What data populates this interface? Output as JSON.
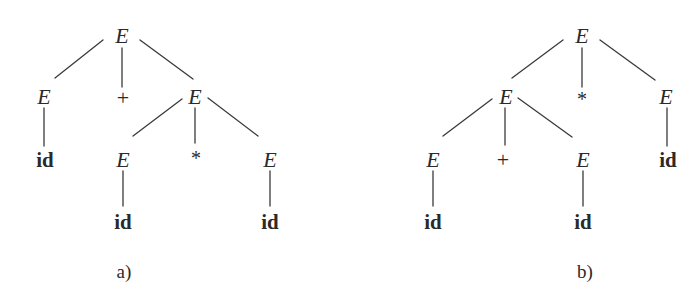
{
  "figure": {
    "background": "#ffffff",
    "ink_color": "#2a2a2a",
    "trees": [
      {
        "id": "tree-a",
        "caption": "a)",
        "caption_pos": [
          124,
          271
        ],
        "nodes": [
          {
            "key": "a_root",
            "label": "E",
            "kind": "nonterminal",
            "x": 122,
            "y": 36
          },
          {
            "key": "a_l",
            "label": "E",
            "kind": "nonterminal",
            "x": 44,
            "y": 97
          },
          {
            "key": "a_plus",
            "label": "+",
            "kind": "operator",
            "x": 123,
            "y": 98
          },
          {
            "key": "a_r",
            "label": "E",
            "kind": "nonterminal",
            "x": 195,
            "y": 97
          },
          {
            "key": "a_l_id",
            "label": "id",
            "kind": "terminal",
            "x": 45,
            "y": 160
          },
          {
            "key": "a_rl",
            "label": "E",
            "kind": "nonterminal",
            "x": 123,
            "y": 160
          },
          {
            "key": "a_star",
            "label": "*",
            "kind": "operator",
            "x": 196,
            "y": 158
          },
          {
            "key": "a_rr",
            "label": "E",
            "kind": "nonterminal",
            "x": 270,
            "y": 160
          },
          {
            "key": "a_rl_id",
            "label": "id",
            "kind": "terminal",
            "x": 123,
            "y": 222
          },
          {
            "key": "a_rr_id",
            "label": "id",
            "kind": "terminal",
            "x": 270,
            "y": 222
          }
        ],
        "edges": [
          [
            103,
            40,
            55,
            78
          ],
          [
            122,
            48,
            122,
            87
          ],
          [
            140,
            40,
            193,
            79
          ],
          [
            44,
            108,
            44,
            146
          ],
          [
            182,
            99,
            133,
            136
          ],
          [
            195,
            108,
            195,
            143
          ],
          [
            208,
            98,
            258,
            136
          ],
          [
            123,
            171,
            123,
            206
          ],
          [
            270,
            171,
            270,
            206
          ]
        ]
      },
      {
        "id": "tree-b",
        "caption": "b)",
        "caption_pos": [
          585,
          271
        ],
        "nodes": [
          {
            "key": "b_root",
            "label": "E",
            "kind": "nonterminal",
            "x": 582,
            "y": 36
          },
          {
            "key": "b_l",
            "label": "E",
            "kind": "nonterminal",
            "x": 506,
            "y": 97
          },
          {
            "key": "b_star",
            "label": "*",
            "kind": "operator",
            "x": 582,
            "y": 99
          },
          {
            "key": "b_r",
            "label": "E",
            "kind": "nonterminal",
            "x": 666,
            "y": 97
          },
          {
            "key": "b_ll",
            "label": "E",
            "kind": "nonterminal",
            "x": 433,
            "y": 160
          },
          {
            "key": "b_plus",
            "label": "+",
            "kind": "operator",
            "x": 503,
            "y": 160
          },
          {
            "key": "b_lr",
            "label": "E",
            "kind": "nonterminal",
            "x": 583,
            "y": 160
          },
          {
            "key": "b_r_id",
            "label": "id",
            "kind": "terminal",
            "x": 668,
            "y": 160
          },
          {
            "key": "b_ll_id",
            "label": "id",
            "kind": "terminal",
            "x": 433,
            "y": 222
          },
          {
            "key": "b_lr_id",
            "label": "id",
            "kind": "terminal",
            "x": 583,
            "y": 222
          }
        ],
        "edges": [
          [
            563,
            40,
            512,
            78
          ],
          [
            582,
            48,
            582,
            87
          ],
          [
            600,
            40,
            655,
            80
          ],
          [
            492,
            99,
            443,
            136
          ],
          [
            505,
            108,
            505,
            145
          ],
          [
            518,
            98,
            572,
            137
          ],
          [
            667,
            108,
            667,
            146
          ],
          [
            433,
            171,
            433,
            206
          ],
          [
            583,
            171,
            583,
            206
          ]
        ]
      }
    ]
  }
}
